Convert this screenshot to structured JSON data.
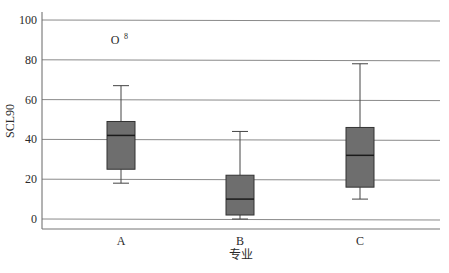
{
  "chart_data": {
    "type": "boxplot",
    "title": "",
    "xlabel": "专业",
    "ylabel": "SCL90",
    "ylim": [
      -5,
      105
    ],
    "yticks": [
      0,
      20,
      40,
      60,
      80,
      100
    ],
    "grid": true,
    "categories": [
      "A",
      "B",
      "C"
    ],
    "series": [
      {
        "name": "A",
        "whisker_low": 18,
        "q1": 25,
        "median": 42,
        "q3": 49,
        "whisker_high": 67
      },
      {
        "name": "B",
        "whisker_low": 0,
        "q1": 2,
        "median": 10,
        "q3": 22,
        "whisker_high": 44
      },
      {
        "name": "C",
        "whisker_low": 10,
        "q1": 16,
        "median": 32,
        "q3": 46,
        "whisker_high": 78
      }
    ],
    "outliers": [
      {
        "category": "A",
        "value": 90,
        "marker": "O",
        "case_label": "8"
      }
    ],
    "colors": {
      "box_fill": "#6e6e6e",
      "box_stroke": "#333333",
      "grid": "#8a8a8a",
      "axis": "#555555"
    }
  }
}
